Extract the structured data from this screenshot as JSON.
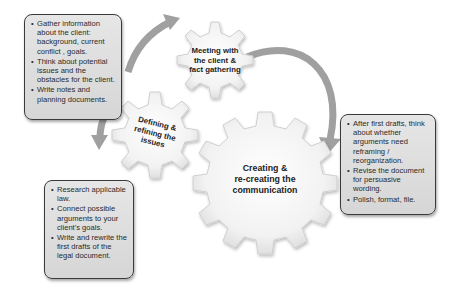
{
  "diagram": {
    "gears": [
      {
        "id": "meeting",
        "label_lines": [
          "Meeting with",
          "the client &",
          "fact gathering"
        ]
      },
      {
        "id": "defining",
        "label_lines": [
          "Defining &",
          "refining the",
          "issues"
        ]
      },
      {
        "id": "creating",
        "label_lines": [
          "Creating &",
          "re-creating the",
          "communication"
        ]
      }
    ],
    "boxes": {
      "meeting": {
        "bullets": [
          "Gather information about the client: background, current conflict , goals.",
          "Think about potential issues and the obstacles for the client.",
          "Write notes and planning documents."
        ]
      },
      "creating": {
        "bullets": [
          "After first drafts, think about whether arguments need reframing / reorganization.",
          "Revise the document for persuasive wording.",
          "Polish, format, file."
        ]
      },
      "defining": {
        "bullets": [
          "Research applicable law.",
          "Connect possible arguments to your client's goals.",
          "Write and rewrite the first drafts of the legal document."
        ]
      }
    },
    "colors": {
      "box_fill": "#dcdcdc",
      "box_border": "#3a3a3a",
      "arrow": "#9a9a9a",
      "gear_fill": "#f4f4f4",
      "gear_edge": "#c8c8c8"
    }
  }
}
